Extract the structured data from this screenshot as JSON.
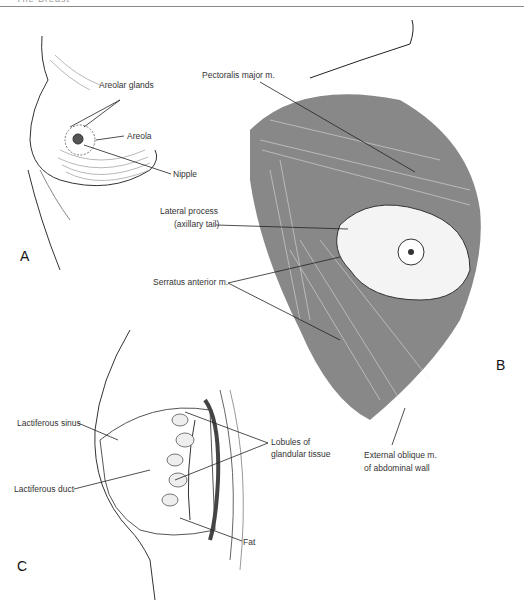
{
  "header": {
    "text": "The Breast"
  },
  "panels": {
    "a": {
      "letter": "A",
      "labels": {
        "areolar_glands": "Areolar glands",
        "areola": "Areola",
        "nipple": "Nipple"
      }
    },
    "b": {
      "letter": "B",
      "labels": {
        "pectoralis": "Pectoralis major m.",
        "lateral_1": "Lateral process",
        "lateral_2": "(axillary tail)",
        "serratus": "Serratus anterior m.",
        "oblique_1": "External oblique m.",
        "oblique_2": "of abdominal wall"
      }
    },
    "c": {
      "letter": "C",
      "labels": {
        "sinus": "Lactiferous sinus",
        "duct": "Lactiferous duct",
        "lobules_1": "Lobules of",
        "lobules_2": "glandular tissue",
        "fat": "Fat"
      }
    }
  },
  "colors": {
    "ink": "#222222",
    "muscle": "#555555",
    "rule": "#8a8a8a"
  }
}
